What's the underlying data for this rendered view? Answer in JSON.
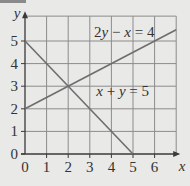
{
  "chart_data": {
    "type": "line",
    "title": "",
    "xlabel": "x",
    "ylabel": "y",
    "xlim": [
      0,
      7
    ],
    "ylim": [
      0,
      6.1
    ],
    "grid": true,
    "x_ticks": [
      "0",
      "1",
      "2",
      "3",
      "4",
      "5",
      "6"
    ],
    "y_ticks": [
      "0",
      "1",
      "2",
      "3",
      "4",
      "5"
    ],
    "series": [
      {
        "name": "2y − x = 4",
        "label": "2y − x = 4",
        "points": [
          [
            0,
            2
          ],
          [
            7,
            5.5
          ]
        ]
      },
      {
        "name": "x + y = 5",
        "label": "x + y = 5",
        "points": [
          [
            0,
            5
          ],
          [
            5,
            0
          ]
        ]
      }
    ],
    "intersection": [
      2,
      3
    ],
    "colors": {
      "grid": "#8c8c8c",
      "line": "#6e6e6e",
      "axis": "#3a3a3a",
      "background": "#e9e9e7"
    }
  }
}
